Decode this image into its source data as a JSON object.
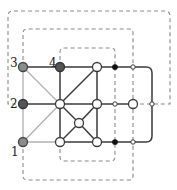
{
  "diagram": {
    "width": 177,
    "height": 190,
    "colors": {
      "dark_edge": "#3a3a3a",
      "gray_edge": "#b0b0b0",
      "dashed": "#8a8a8a",
      "gray_node_fill": "#8c8c8c",
      "dark_node_fill": "#555555",
      "white_node_fill": "#ffffff",
      "black_dot": "#111111"
    },
    "labels": [
      {
        "id": "1",
        "text": "1",
        "x": 11,
        "y": 156
      },
      {
        "id": "2",
        "text": "2",
        "x": 10,
        "y": 108
      },
      {
        "id": "3",
        "text": "3",
        "x": 10,
        "y": 67
      },
      {
        "id": "4",
        "text": "4",
        "x": 49,
        "y": 67
      }
    ],
    "nodes": [
      {
        "id": "n1",
        "x": 23,
        "y": 142,
        "r": 4.5,
        "kind": "gray"
      },
      {
        "id": "n2",
        "x": 23,
        "y": 104,
        "r": 4.5,
        "kind": "dark"
      },
      {
        "id": "n3",
        "x": 23,
        "y": 67,
        "r": 4.5,
        "kind": "gray"
      },
      {
        "id": "n4",
        "x": 60,
        "y": 67,
        "r": 4.5,
        "kind": "dark"
      },
      {
        "id": "a",
        "x": 97,
        "y": 67,
        "r": 4.5,
        "kind": "white"
      },
      {
        "id": "b",
        "x": 60,
        "y": 104,
        "r": 4.5,
        "kind": "white"
      },
      {
        "id": "c",
        "x": 97,
        "y": 104,
        "r": 4.5,
        "kind": "white"
      },
      {
        "id": "d",
        "x": 60,
        "y": 142,
        "r": 4.5,
        "kind": "white"
      },
      {
        "id": "e",
        "x": 97,
        "y": 142,
        "r": 4.5,
        "kind": "white"
      },
      {
        "id": "f",
        "x": 79,
        "y": 123,
        "r": 4.5,
        "kind": "white"
      },
      {
        "id": "g",
        "x": 115,
        "y": 67,
        "r": 2.2,
        "kind": "black"
      },
      {
        "id": "h",
        "x": 115,
        "y": 104,
        "r": 2.2,
        "kind": "small"
      },
      {
        "id": "i",
        "x": 115,
        "y": 142,
        "r": 2.2,
        "kind": "black"
      },
      {
        "id": "j",
        "x": 133,
        "y": 67,
        "r": 2.2,
        "kind": "small"
      },
      {
        "id": "k",
        "x": 133,
        "y": 104,
        "r": 4.5,
        "kind": "white"
      },
      {
        "id": "l",
        "x": 133,
        "y": 142,
        "r": 2.2,
        "kind": "small"
      },
      {
        "id": "m",
        "x": 152,
        "y": 104,
        "r": 2.2,
        "kind": "small"
      }
    ],
    "edges": [
      {
        "from": "n3",
        "to": "n4",
        "style": "dark"
      },
      {
        "from": "n4",
        "to": "a",
        "style": "dark"
      },
      {
        "from": "a",
        "to": "g",
        "style": "dark"
      },
      {
        "from": "g",
        "to": "j",
        "style": "dark"
      },
      {
        "from": "n2",
        "to": "b",
        "style": "dark"
      },
      {
        "from": "b",
        "to": "c",
        "style": "dark"
      },
      {
        "from": "c",
        "to": "h",
        "style": "dark"
      },
      {
        "from": "h",
        "to": "k",
        "style": "dark"
      },
      {
        "from": "d",
        "to": "e",
        "style": "dark"
      },
      {
        "from": "e",
        "to": "i",
        "style": "dark"
      },
      {
        "from": "i",
        "to": "l",
        "style": "dark"
      },
      {
        "from": "n4",
        "to": "b",
        "style": "dark"
      },
      {
        "from": "b",
        "to": "d",
        "style": "dark"
      },
      {
        "from": "a",
        "to": "c",
        "style": "dark"
      },
      {
        "from": "c",
        "to": "e",
        "style": "dark"
      },
      {
        "from": "a",
        "to": "b",
        "style": "dark"
      },
      {
        "from": "b",
        "to": "f",
        "style": "dark"
      },
      {
        "from": "c",
        "to": "f",
        "style": "dark"
      },
      {
        "from": "d",
        "to": "f",
        "style": "dark"
      },
      {
        "from": "e",
        "to": "f",
        "style": "dark"
      },
      {
        "from": "n3",
        "to": "n2",
        "style": "gray"
      },
      {
        "from": "n2",
        "to": "n1",
        "style": "gray"
      },
      {
        "from": "n3",
        "to": "b",
        "style": "gray"
      },
      {
        "from": "n1",
        "to": "b",
        "style": "gray"
      },
      {
        "from": "n1",
        "to": "d",
        "style": "gray"
      }
    ],
    "solid_paths": [
      {
        "name": "right-loop",
        "d": "M133,67 L146,67 Q152,67 152,73 L152,136 Q152,142 146,142 L133,142"
      }
    ],
    "dashed_paths": [
      {
        "name": "outer-dashed-loop",
        "d": "M23,104 L8,104 L8,16 Q8,11 13,11 L165,11 Q170,11 170,16 L170,104 L152,104"
      },
      {
        "name": "middle-dashed-top",
        "d": "M23,67 L23,33 Q23,29 27,29 L129,29 Q133,29 133,33 L133,67"
      },
      {
        "name": "inner-dashed-top",
        "d": "M60,67 L60,52 Q60,48 64,48 L111,48 Q115,48 115,52 L115,67"
      },
      {
        "name": "inner-dashed-bottom",
        "d": "M60,142 L60,157 Q60,161 64,161 L111,161 Q115,161 115,157 L115,142"
      },
      {
        "name": "middle-dashed-bottom",
        "d": "M23,142 L23,176 Q23,180 27,180 L129,180 Q133,180 133,176 L133,142"
      },
      {
        "name": "vertical-dashed-115",
        "d": "M115,67 L115,142"
      },
      {
        "name": "vertical-dashed-133",
        "d": "M133,67 L133,142"
      },
      {
        "name": "horizontal-dashed-right",
        "d": "M133,104 L152,104"
      }
    ]
  }
}
